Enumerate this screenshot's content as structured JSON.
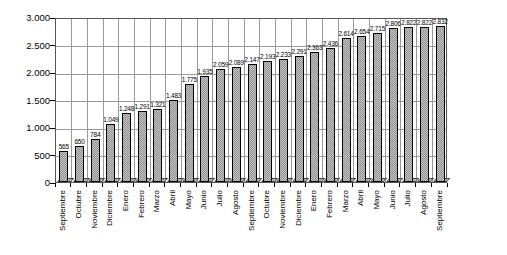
{
  "chart_data": {
    "type": "bar",
    "title": "",
    "xlabel": "",
    "ylabel": "",
    "legend": "none",
    "grid": "both",
    "categories": [
      "Septiembre",
      "Octubre",
      "Noviembre",
      "Diciembre",
      "Enero",
      "Febrero",
      "Marzo",
      "Abril",
      "Mayo",
      "Junio",
      "Julio",
      "Agosto",
      "Septiembre",
      "Octubre",
      "Noviembre",
      "Diciembre",
      "Enero",
      "Febrero",
      "Marzo",
      "Abril",
      "Mayo",
      "Junio",
      "Julio",
      "Agosto",
      "Septiembre"
    ],
    "values": [
      565,
      650,
      784,
      1049,
      1248,
      1291,
      1321,
      1483,
      1775,
      1935,
      2059,
      2089,
      2147,
      2193,
      2233,
      2291,
      2363,
      2436,
      2614,
      2654,
      2715,
      2806,
      2822,
      2822,
      2832
    ],
    "value_labels": [
      "565",
      "650",
      "784",
      "1.049",
      "1.248",
      "1.291",
      "1.321",
      "1.483",
      "1.775",
      "1.935",
      "2.059",
      "2.089",
      "2.147",
      "2.193",
      "2.233",
      "2.291",
      "2.363",
      "2.436",
      "2.614",
      "2.654",
      "2.715",
      "2.806",
      "2.822",
      "2.822",
      "2.832"
    ],
    "ylim": [
      0,
      3000
    ],
    "ytick_values": [
      0,
      500,
      1000,
      1500,
      2000,
      2500,
      3000
    ],
    "ytick_labels": [
      "0",
      "500",
      "1.000",
      "1.500",
      "2.000",
      "2.500",
      "3.000"
    ],
    "colors": {
      "background": "#ffffff",
      "bar_fill_light": "#c6c6c6",
      "bar_fill_dark": "#8e8e8e",
      "bar_border": "#000000",
      "gridline": "#9a9a9a",
      "axis": "#000000",
      "text": "#000000"
    }
  }
}
